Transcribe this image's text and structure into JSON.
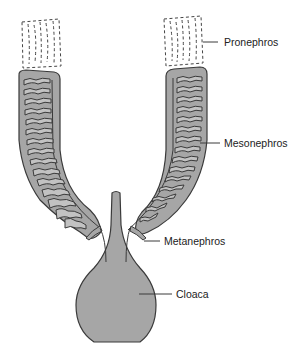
{
  "diagram": {
    "type": "anatomical-illustration",
    "colors": {
      "tissue_fill": "#a6a6a6",
      "tubule_fill": "#c2c2c2",
      "outline": "#3a3a3a",
      "dashed_outline": "#444444",
      "background": "#ffffff"
    },
    "labels": {
      "pronephros": "Pronephros",
      "mesonephros": "Mesonephros",
      "metanephros": "Metanephros",
      "cloaca": "Cloaca"
    }
  }
}
